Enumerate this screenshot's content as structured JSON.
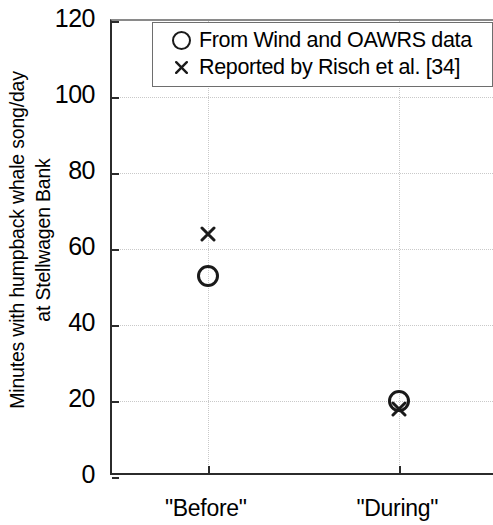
{
  "chart_data": {
    "type": "scatter",
    "title": "",
    "xlabel": "",
    "ylabel": "Minutes with humpback whale song/day at Stellwagen Bank",
    "ylabel_lines": [
      "Minutes with humpback whale song/day",
      "at Stellwagen Bank"
    ],
    "categories": [
      "\"Before\"",
      "\"During\""
    ],
    "x": [
      1,
      2
    ],
    "xlim": [
      0.5,
      2.5
    ],
    "ylim": [
      0,
      120
    ],
    "yticks": [
      0,
      20,
      40,
      60,
      80,
      100,
      120
    ],
    "ytick_labels": [
      "0",
      "20",
      "40",
      "60",
      "80",
      "100",
      "120"
    ],
    "grid": true,
    "grid_style": "dotted",
    "grid_color": "#c9c9c9",
    "legend_position": "top-right",
    "series": [
      {
        "name": "From Wind and OAWRS data",
        "marker": "circle-open",
        "color": "#1a1a1a",
        "values": [
          53,
          20
        ]
      },
      {
        "name": "Reported by Risch et al. [34]",
        "marker": "x",
        "color": "#1a1a1a",
        "values": [
          64,
          18
        ]
      }
    ]
  },
  "legend": {
    "entries": [
      {
        "symbol": "circle-open-marker",
        "label": "From Wind and OAWRS data"
      },
      {
        "symbol": "x-marker",
        "label": "Reported by Risch et al. [34]"
      }
    ]
  },
  "axes": {
    "y_title_line1": "Minutes with humpback whale song/day",
    "y_title_line2": "at Stellwagen Bank",
    "y_tick_labels": [
      "120",
      "100",
      "80",
      "60",
      "40",
      "20",
      "0"
    ],
    "x_tick_labels": [
      "\"Before\"",
      "\"During\""
    ]
  },
  "colors": {
    "axis": "#2b2b2b",
    "grid": "#c9c9c9",
    "marker": "#1a1a1a",
    "background": "#ffffff",
    "legend_border": "#6e6e6e"
  }
}
